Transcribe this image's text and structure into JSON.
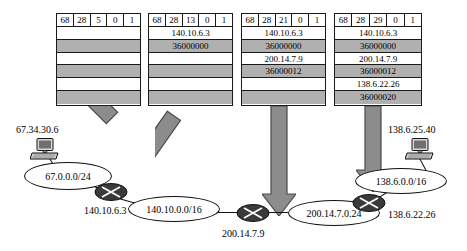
{
  "packets": [
    {
      "id": "packet-1",
      "header": [
        "68",
        "28",
        "5",
        "0",
        "1"
      ],
      "rows": [
        {
          "text": "",
          "shaded": false
        },
        {
          "text": "",
          "shaded": true
        },
        {
          "text": "",
          "shaded": false
        },
        {
          "text": "",
          "shaded": true
        },
        {
          "text": "",
          "shaded": false
        },
        {
          "text": "",
          "shaded": true
        }
      ]
    },
    {
      "id": "packet-2",
      "header": [
        "68",
        "28",
        "13",
        "0",
        "1"
      ],
      "rows": [
        {
          "text": "140.10.6.3",
          "shaded": false
        },
        {
          "text": "36000000",
          "shaded": true
        },
        {
          "text": "",
          "shaded": false
        },
        {
          "text": "",
          "shaded": true
        },
        {
          "text": "",
          "shaded": false
        },
        {
          "text": "",
          "shaded": true
        }
      ]
    },
    {
      "id": "packet-3",
      "header": [
        "68",
        "28",
        "21",
        "0",
        "1"
      ],
      "rows": [
        {
          "text": "140.10.6.3",
          "shaded": false
        },
        {
          "text": "36000000",
          "shaded": true
        },
        {
          "text": "200.14.7.9",
          "shaded": false
        },
        {
          "text": "36000012",
          "shaded": true
        },
        {
          "text": "",
          "shaded": false
        },
        {
          "text": "",
          "shaded": true
        }
      ]
    },
    {
      "id": "packet-4",
      "header": [
        "68",
        "28",
        "29",
        "0",
        "1"
      ],
      "rows": [
        {
          "text": "140.10.6.3",
          "shaded": false
        },
        {
          "text": "36000000",
          "shaded": true
        },
        {
          "text": "200.14.7.9",
          "shaded": false
        },
        {
          "text": "36000012",
          "shaded": true
        },
        {
          "text": "138.6.22.26",
          "shaded": false
        },
        {
          "text": "36000020",
          "shaded": true
        }
      ]
    }
  ],
  "network": {
    "source_host_label": "67.34.30.6",
    "dest_host_label": "138.6.25.40",
    "clouds": [
      {
        "id": "cloud-67",
        "label": "67.0.0.0/24"
      },
      {
        "id": "cloud-140",
        "label": "140.10.0.0/16"
      },
      {
        "id": "cloud-200",
        "label": "200.14.7.0.24"
      },
      {
        "id": "cloud-138",
        "label": "138.6.0.0/16"
      }
    ],
    "router_labels": [
      {
        "id": "router-label-140",
        "label": "140.10.6.3"
      },
      {
        "id": "router-label-200",
        "label": "200.14.7.9"
      },
      {
        "id": "router-label-138",
        "label": "138.6.22.26"
      }
    ]
  },
  "colors": {
    "shaded_row": "#b0b0b0",
    "arrow_fill": "#8c8c8c",
    "arrow_stroke": "#4a4a4a",
    "line": "#111111",
    "router_body": "#3a3a3a"
  }
}
